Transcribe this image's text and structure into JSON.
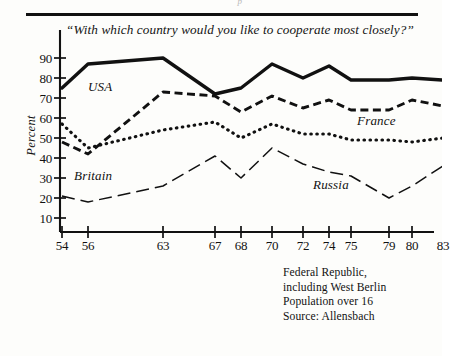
{
  "figure": {
    "clipped_header": "p",
    "question": "“With which country would you like to cooperate most closely?”",
    "ylabel": "Percent"
  },
  "notes": {
    "line1": "Federal Republic,",
    "line2": "including West Berlin",
    "line3": "Population over 16",
    "line4": "Source: Allensbach"
  },
  "labels": {
    "usa": "USA",
    "france": "France",
    "britain": "Britain",
    "russia": "Russia"
  },
  "chart_data": {
    "type": "line",
    "title": "“With which country would you like to cooperate most closely?”",
    "xlabel": "",
    "ylabel": "Percent",
    "ylim": [
      0,
      95
    ],
    "yticks": [
      10,
      20,
      30,
      40,
      50,
      60,
      70,
      80,
      90
    ],
    "xticks": [
      "54",
      "56",
      "63",
      "67",
      "68",
      "70",
      "72",
      "74",
      "75",
      "79",
      "80",
      "83"
    ],
    "grid": false,
    "legend": "inline-annotations",
    "x": [
      "54",
      "56",
      "63",
      "67",
      "68",
      "70",
      "72",
      "74",
      "75",
      "79",
      "80",
      "83"
    ],
    "series": [
      {
        "name": "USA",
        "style": "solid-thick",
        "color": "#111111",
        "x": [
          "54",
          "56",
          "63",
          "67",
          "68",
          "70",
          "72",
          "74",
          "75",
          "79",
          "80",
          "83"
        ],
        "values": [
          75,
          87,
          90,
          72,
          75,
          87,
          80,
          86,
          79,
          79,
          80,
          79
        ]
      },
      {
        "name": "France",
        "style": "dashed",
        "color": "#111111",
        "x": [
          "54",
          "56",
          "63",
          "67",
          "68",
          "70",
          "72",
          "74",
          "75",
          "79",
          "80",
          "83"
        ],
        "values": [
          48,
          42,
          73,
          71,
          63,
          71,
          65,
          69,
          64,
          64,
          69,
          66
        ]
      },
      {
        "name": "Britain",
        "style": "dotted",
        "color": "#111111",
        "x": [
          "54",
          "56",
          "63",
          "67",
          "68",
          "70",
          "72",
          "74",
          "75",
          "79",
          "80",
          "83"
        ],
        "values": [
          57,
          45,
          54,
          58,
          50,
          57,
          52,
          52,
          49,
          49,
          48,
          50
        ]
      },
      {
        "name": "Russia",
        "style": "long-dash",
        "color": "#111111",
        "x": [
          "54",
          "56",
          "63",
          "67",
          "68",
          "70",
          "72",
          "74",
          "75",
          "79",
          "80",
          "83"
        ],
        "values": [
          21,
          18,
          26,
          41,
          30,
          45,
          37,
          33,
          31,
          20,
          26,
          36
        ]
      }
    ]
  }
}
